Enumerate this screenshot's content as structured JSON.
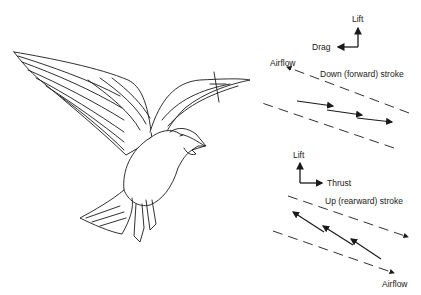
{
  "figure": {
    "top_panel": {
      "force_axes": {
        "vertical": "Lift",
        "horizontal": "Drag"
      },
      "airflow_label": "Airflow",
      "stroke_label": "Down (forward) stroke"
    },
    "bottom_panel": {
      "force_axes": {
        "vertical": "Lift",
        "horizontal": "Thrust"
      },
      "stroke_label": "Up (rearward) stroke",
      "airflow_label": "Airflow"
    }
  }
}
